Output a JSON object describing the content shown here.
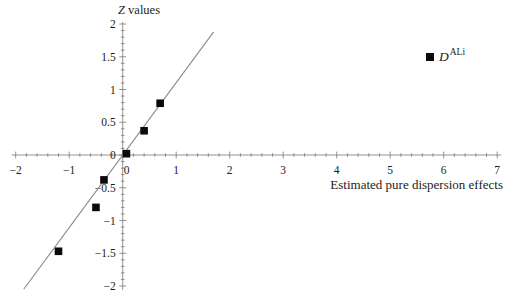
{
  "figure": {
    "background": "#ffffff",
    "y_axis_title": {
      "italic": "Z",
      "rest": " values"
    },
    "x_axis_label": "Estimated pure dispersion effects",
    "legend": {
      "marker": "black-filled-square",
      "base": "D",
      "superscript": "ALi"
    }
  },
  "chart_data": {
    "type": "scatter",
    "title": "",
    "xlabel": "Estimated pure dispersion effects",
    "ylabel": "Z values",
    "xlim": [
      -2,
      7
    ],
    "ylim": [
      -2,
      2
    ],
    "x_major_ticks": [
      -2,
      -1,
      0,
      1,
      2,
      3,
      4,
      5,
      6,
      7
    ],
    "x_tick_labels": [
      "−2",
      "−1",
      "0",
      "1",
      "2",
      "3",
      "4",
      "5",
      "6",
      "7"
    ],
    "x_minor_tick_step": 0.2,
    "y_major_ticks": [
      -2,
      -1.5,
      -1,
      -0.5,
      0,
      0.5,
      1,
      1.5,
      2
    ],
    "y_tick_labels": [
      "−2",
      "−1.5",
      "−1",
      "−0.5",
      "0",
      "0.5",
      "1",
      "1.5",
      "2"
    ],
    "y_minor_tick_step": 0.1,
    "grid": false,
    "legend_position": "inside-top-right",
    "series": [
      {
        "name": "D^ALi",
        "marker": "filled-square",
        "color": "#0a0a0a",
        "points": [
          [
            -1.2,
            -1.47
          ],
          [
            -0.5,
            -0.8
          ],
          [
            -0.35,
            -0.38
          ],
          [
            0.07,
            0.02
          ],
          [
            0.4,
            0.37
          ],
          [
            0.7,
            0.79
          ]
        ]
      }
    ],
    "fit_line": {
      "from": [
        -1.85,
        -2.05
      ],
      "to": [
        1.7,
        1.88
      ],
      "slope": 1.11,
      "intercept": 0,
      "color": "#8a8a8a"
    },
    "axis_color": "#777777",
    "text_color": "#1c1c1c"
  }
}
